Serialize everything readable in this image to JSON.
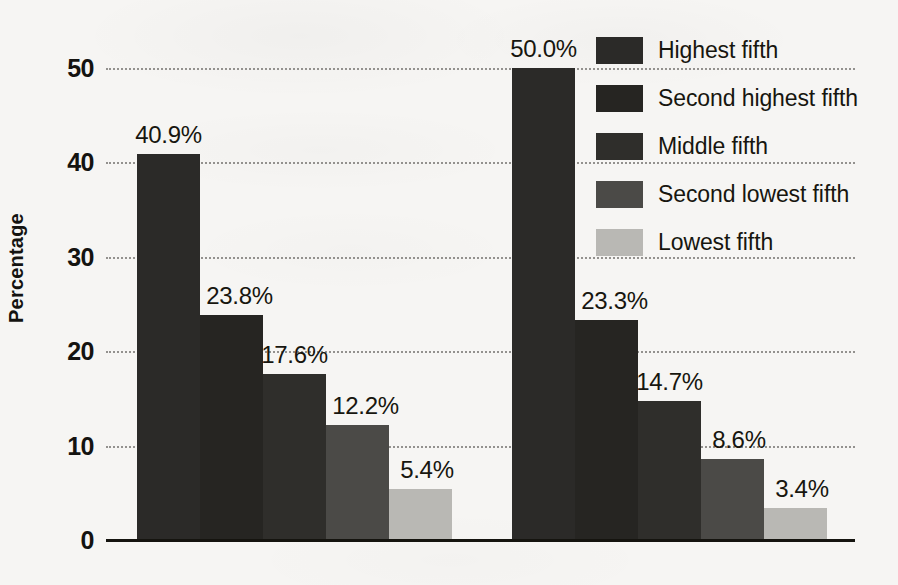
{
  "chart_data": {
    "type": "bar",
    "title": "",
    "subtitle": "",
    "xlabel": "",
    "ylabel": "Percentage",
    "categories": [
      "1970",
      "2008"
    ],
    "series": [
      {
        "name": "Highest fifth",
        "values": [
          40.9,
          50.0
        ],
        "color": "#2b2a28"
      },
      {
        "name": "Second highest fifth",
        "values": [
          23.8,
          23.3
        ],
        "color": "#262522"
      },
      {
        "name": "Middle fifth",
        "values": [
          17.6,
          14.7
        ],
        "color": "#2f2e2b"
      },
      {
        "name": "Second lowest fifth",
        "values": [
          12.2,
          8.6
        ],
        "color": "#4b4a47"
      },
      {
        "name": "Lowest fifth",
        "values": [
          5.4,
          3.4
        ],
        "color": "#b9b8b4"
      }
    ],
    "data_labels": {
      "1970": [
        "40.9%",
        "23.8%",
        "17.6%",
        "12.2%",
        "5.4%"
      ],
      "2008": [
        "50.0%",
        "23.3%",
        "14.7%",
        "8.6%",
        "3.4%"
      ]
    },
    "yticks": [
      0,
      10,
      20,
      30,
      40,
      50
    ],
    "ytick_labels": [
      "0",
      "10",
      "20",
      "30",
      "40",
      "50"
    ],
    "ylim": [
      0,
      50
    ],
    "grid": true,
    "grid_style": "dotted",
    "legend_position": "top-right",
    "bar_gap_within_group": 0,
    "background_color": "#f6f5f3"
  },
  "axis": {
    "y_title": "Percentage",
    "ticks": [
      {
        "value": 50,
        "label": "50"
      },
      {
        "value": 40,
        "label": "40"
      },
      {
        "value": 30,
        "label": "30"
      },
      {
        "value": 20,
        "label": "20"
      },
      {
        "value": 10,
        "label": "10"
      },
      {
        "value": 0,
        "label": "0"
      }
    ]
  },
  "groups": [
    {
      "label": "1970",
      "bars": [
        {
          "series": "Highest fifth",
          "value": 40.9,
          "label": "40.9%"
        },
        {
          "series": "Second highest fifth",
          "value": 23.8,
          "label": "23.8%"
        },
        {
          "series": "Middle fifth",
          "value": 17.6,
          "label": "17.6%"
        },
        {
          "series": "Second lowest fifth",
          "value": 12.2,
          "label": "12.2%"
        },
        {
          "series": "Lowest fifth",
          "value": 5.4,
          "label": "5.4%"
        }
      ]
    },
    {
      "label": "2008",
      "bars": [
        {
          "series": "Highest fifth",
          "value": 50.0,
          "label": "50.0%"
        },
        {
          "series": "Second highest fifth",
          "value": 23.3,
          "label": "23.3%"
        },
        {
          "series": "Middle fifth",
          "value": 14.7,
          "label": "14.7%"
        },
        {
          "series": "Second lowest fifth",
          "value": 8.6,
          "label": "8.6%"
        },
        {
          "series": "Lowest fifth",
          "value": 3.4,
          "label": "3.4%"
        }
      ]
    }
  ],
  "legend": {
    "items": [
      {
        "label": "Highest fifth",
        "color": "#2b2a28"
      },
      {
        "label": "Second highest fifth",
        "color": "#262522"
      },
      {
        "label": "Middle fifth",
        "color": "#2f2e2b"
      },
      {
        "label": "Second lowest fifth",
        "color": "#4b4a47"
      },
      {
        "label": "Lowest fifth",
        "color": "#b9b8b4"
      }
    ]
  }
}
